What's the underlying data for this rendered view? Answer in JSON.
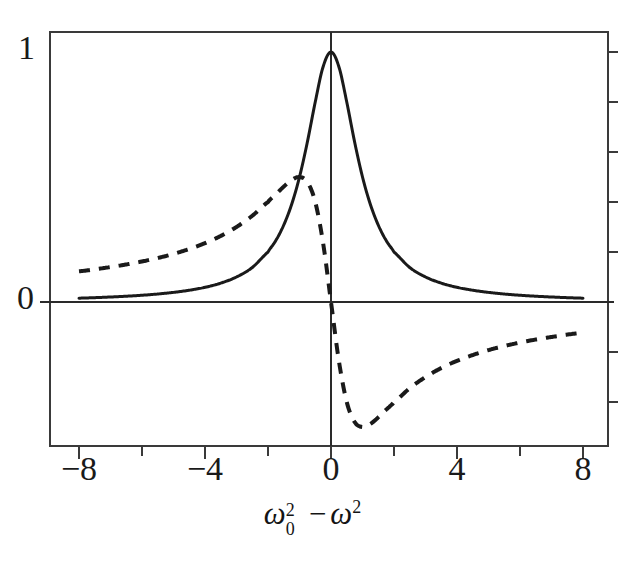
{
  "chart_data": {
    "type": "line",
    "title": "",
    "xlabel": "ω₀² − ω²",
    "ylabel": "",
    "xlim": [
      -8.9,
      8.8
    ],
    "ylim": [
      -0.576,
      1.08
    ],
    "grid": false,
    "legend": "none",
    "x_ticks_major": [
      -8,
      -4,
      0,
      4,
      8
    ],
    "x_ticks_minor": [
      -6,
      -2,
      2,
      6
    ],
    "x_tick_labels": [
      "−8",
      "−4",
      "0",
      "4",
      "8"
    ],
    "y_tick_labels": [
      "1",
      "0"
    ],
    "y_ticks_major": [
      0,
      1
    ],
    "y_ticks_minor_right": [
      -0.4,
      -0.2,
      0.2,
      0.4,
      0.6,
      0.8,
      1.0
    ],
    "series": [
      {
        "name": "absorption",
        "style": "solid",
        "color": "#1a1a1a",
        "formula": "1 / (x^2 + 1)",
        "x": [
          -8,
          -7.5,
          -7,
          -6.5,
          -6,
          -5.5,
          -5,
          -4.5,
          -4,
          -3.5,
          -3,
          -2.5,
          -2,
          -1.75,
          -1.5,
          -1.25,
          -1,
          -0.75,
          -0.5,
          -0.25,
          0,
          0.25,
          0.5,
          0.75,
          1,
          1.25,
          1.5,
          1.75,
          2,
          2.5,
          3,
          3.5,
          4,
          4.5,
          5,
          5.5,
          6,
          6.5,
          7,
          7.5,
          8
        ],
        "y": [
          0.0154,
          0.0174,
          0.02,
          0.0231,
          0.027,
          0.032,
          0.0385,
          0.0471,
          0.0588,
          0.0755,
          0.1,
          0.1379,
          0.2,
          0.246,
          0.3077,
          0.3902,
          0.5,
          0.64,
          0.8,
          0.9412,
          1.0,
          0.9412,
          0.8,
          0.64,
          0.5,
          0.3902,
          0.3077,
          0.246,
          0.2,
          0.1379,
          0.1,
          0.0755,
          0.0588,
          0.0471,
          0.0385,
          0.032,
          0.027,
          0.0231,
          0.02,
          0.0174,
          0.0154
        ]
      },
      {
        "name": "dispersion",
        "style": "dashed",
        "color": "#1a1a1a",
        "formula": "-x / (x^2 + 1)",
        "x": [
          -8,
          -7.5,
          -7,
          -6.5,
          -6,
          -5.5,
          -5,
          -4.5,
          -4,
          -3.5,
          -3,
          -2.5,
          -2,
          -1.75,
          -1.5,
          -1.25,
          -1,
          -0.75,
          -0.5,
          -0.25,
          0,
          0.25,
          0.5,
          0.75,
          1,
          1.25,
          1.5,
          1.75,
          2,
          2.5,
          3,
          3.5,
          4,
          4.5,
          5,
          5.5,
          6,
          6.5,
          7,
          7.5,
          8
        ],
        "y": [
          0.1231,
          0.1304,
          0.14,
          0.1501,
          0.1622,
          0.176,
          0.1923,
          0.2121,
          0.2353,
          0.2642,
          0.3,
          0.3448,
          0.4,
          0.4308,
          0.4615,
          0.4878,
          0.5,
          0.48,
          0.4,
          0.2353,
          0.0,
          -0.2353,
          -0.4,
          -0.48,
          -0.5,
          -0.4878,
          -0.4615,
          -0.4308,
          -0.4,
          -0.3448,
          -0.3,
          -0.2642,
          -0.2353,
          -0.2121,
          -0.1923,
          -0.176,
          -0.1622,
          -0.1501,
          -0.14,
          -0.1304,
          -0.1231
        ]
      }
    ],
    "axes": {
      "frame_color": "#3a3a3a",
      "zero_horizontal_line": 0,
      "zero_vertical_line": 0
    }
  },
  "figure": {
    "background": "#ffffff",
    "ink": "#1a1a1a"
  }
}
